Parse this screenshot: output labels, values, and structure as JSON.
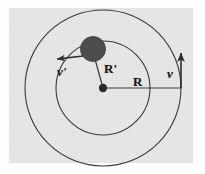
{
  "figure": {
    "canvas": {
      "width": 205,
      "height": 174
    },
    "panel": {
      "background_color": "#e6e6e6",
      "page_color": "#ffffff",
      "left": 9,
      "top": 8,
      "width": 184,
      "height": 155
    },
    "stroke_color": "#2b2b2b",
    "labels": {
      "v_prime": "v'",
      "r_prime": "R'",
      "r": "R",
      "v": "v"
    },
    "elements": {
      "outer_orbit": {
        "name": "outer-orbit-circle",
        "center": [
          103,
          88
        ],
        "radius": 78,
        "label": "R"
      },
      "inner_orbit": {
        "name": "inner-orbit-circle",
        "center": [
          103,
          88
        ],
        "radius": 47,
        "label": "R'"
      },
      "center_point": {
        "name": "center-mass-dot",
        "x": 103,
        "y": 88,
        "radius": 4
      },
      "orbiting_body": {
        "name": "orbiting-body",
        "x": 93,
        "y": 50,
        "radius": 12,
        "fill": "#4a4a4a"
      },
      "radius_line_inner": {
        "name": "radius-line-r-prime",
        "from": [
          103,
          88
        ],
        "to": [
          93,
          50
        ]
      },
      "radius_line_outer": {
        "name": "radius-line-r",
        "from": [
          103,
          88
        ],
        "to": [
          181,
          88
        ]
      },
      "velocity_vector_inner": {
        "name": "velocity-vector-v-prime",
        "from": [
          85,
          58
        ],
        "to": [
          55,
          60
        ],
        "label": "v'"
      },
      "velocity_vector_outer": {
        "name": "velocity-vector-v",
        "from": [
          181,
          88
        ],
        "to": [
          181,
          50
        ],
        "label": "v"
      }
    }
  }
}
